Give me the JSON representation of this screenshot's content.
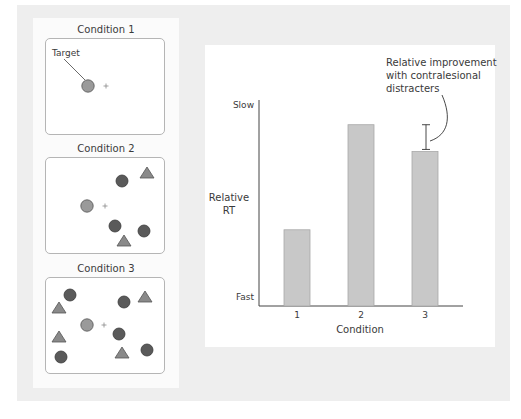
{
  "figure": {
    "panels": [
      {
        "label": "Condition 1",
        "target_label": "Target",
        "target": {
          "x": 88,
          "y": 86
        },
        "fixation": {
          "x": 106,
          "y": 86
        },
        "distracter_circles": [],
        "distracter_triangles": []
      },
      {
        "label": "Condition 2",
        "target": {
          "x": 87,
          "y": 206
        },
        "fixation": {
          "x": 105,
          "y": 206
        },
        "distracter_circles": [
          {
            "x": 122,
            "y": 181
          },
          {
            "x": 115,
            "y": 226
          },
          {
            "x": 144,
            "y": 231
          }
        ],
        "distracter_triangles": [
          {
            "x": 147,
            "y": 173
          },
          {
            "x": 124,
            "y": 241
          }
        ]
      },
      {
        "label": "Condition 3",
        "target": {
          "x": 87,
          "y": 325
        },
        "fixation": {
          "x": 104,
          "y": 325
        },
        "distracter_circles": [
          {
            "x": 70,
            "y": 295
          },
          {
            "x": 124,
            "y": 302
          },
          {
            "x": 119,
            "y": 334
          },
          {
            "x": 61,
            "y": 357
          },
          {
            "x": 147,
            "y": 350
          }
        ],
        "distracter_triangles": [
          {
            "x": 59,
            "y": 308
          },
          {
            "x": 145,
            "y": 297
          },
          {
            "x": 59,
            "y": 337
          },
          {
            "x": 122,
            "y": 353
          }
        ]
      }
    ],
    "colors": {
      "target_fill": "#9a9a9a",
      "distracter_circle_fill": "#5a5a5a",
      "triangle_fill": "#8a8a8a",
      "bar_fill": "#c8c8c8",
      "bar_stroke": "#a8a8a8",
      "axis": "#444444"
    }
  },
  "chart_data": {
    "type": "bar",
    "title": "",
    "xlabel": "Condition",
    "ylabel": "Relative RT",
    "ylabel_lines": [
      "Relative",
      "RT"
    ],
    "y_top_label": "Slow",
    "y_bottom_label": "Fast",
    "categories": [
      "1",
      "2",
      "3"
    ],
    "values": [
      0.37,
      0.88,
      0.75
    ],
    "ylim": [
      0,
      1
    ],
    "grid": false,
    "annotation": {
      "lines": [
        "Relative improvement",
        "with contralesional",
        "distracters"
      ],
      "target_category": "3",
      "error_bar_range": [
        0.76,
        0.88
      ]
    }
  }
}
